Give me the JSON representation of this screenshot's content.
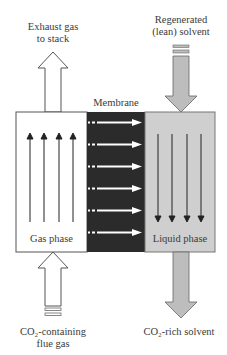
{
  "diagram": {
    "labels": {
      "exhaust_line1": "Exhaust gas",
      "exhaust_line2": "to stack",
      "regen_line1": "Regenerated",
      "regen_line2": "(lean) solvent",
      "membrane": "Membrane",
      "gas_phase": "Gas phase",
      "liquid_phase": "Liquid phase",
      "flue_line1": "CO₂-containing",
      "flue_line2": "flue gas",
      "rich_solvent": "CO₂-rich solvent"
    },
    "colors": {
      "gas_zone": "#ffffff",
      "membrane_zone": "#2b2b2b",
      "liquid_zone": "#cfcfcf",
      "solvent_arrow": "#bdbdbd",
      "outline": "#555555"
    },
    "zones": [
      "Gas phase",
      "Membrane",
      "Liquid phase"
    ],
    "flows": [
      {
        "from": "CO₂-containing flue gas",
        "to": "Gas phase",
        "direction": "up"
      },
      {
        "from": "Gas phase",
        "to": "Exhaust gas to stack",
        "direction": "up"
      },
      {
        "from": "Regenerated (lean) solvent",
        "to": "Liquid phase",
        "direction": "down"
      },
      {
        "from": "Liquid phase",
        "to": "CO₂-rich solvent",
        "direction": "down"
      },
      {
        "from": "Gas phase",
        "to": "Liquid phase",
        "via": "Membrane",
        "direction": "right",
        "count": 6
      }
    ]
  }
}
